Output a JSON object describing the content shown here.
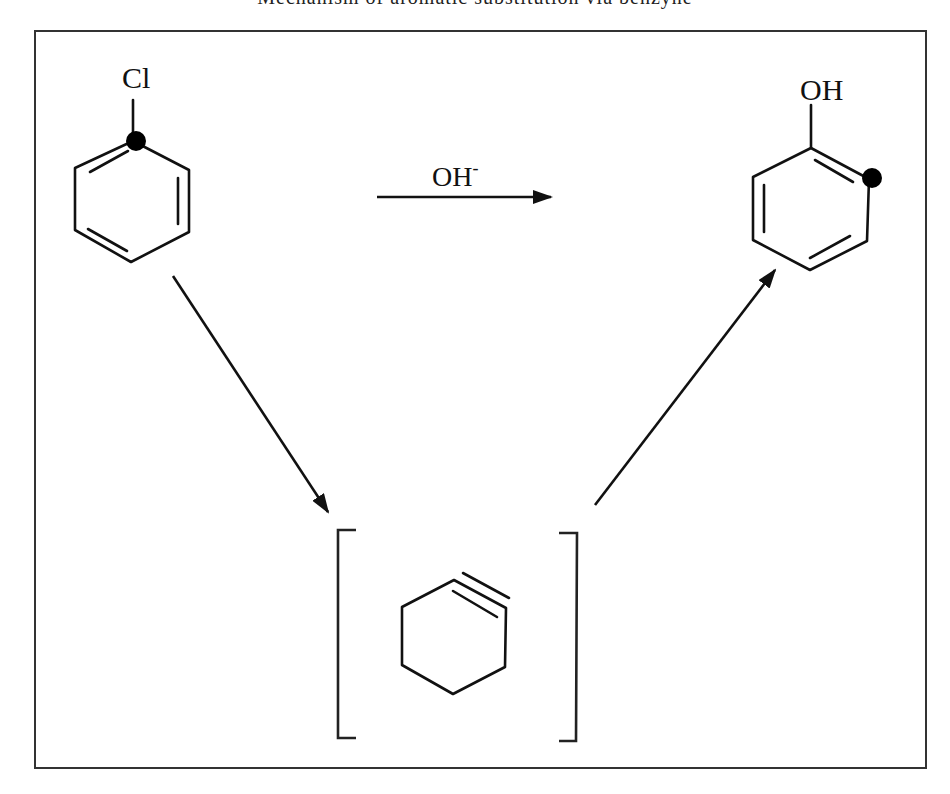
{
  "title": {
    "text": "Mechanism of aromatic substitution via benzyne",
    "visible": "clipped"
  },
  "reactant": {
    "name": "chlorobenzene",
    "substituent_label": "Cl",
    "labeled_carbon": "C1 (ipso, marked with dot)"
  },
  "product": {
    "name": "phenol",
    "substituent_label": "OH",
    "labeled_carbon": "C2 (ortho, marked with dot)"
  },
  "intermediate": {
    "name": "benzyne",
    "bracketed": true
  },
  "reagent": {
    "label": "OH",
    "charge": "-"
  },
  "arrows": [
    {
      "from": "reactant",
      "to": "product",
      "label": "OH-",
      "direction": "right"
    },
    {
      "from": "reactant",
      "to": "intermediate",
      "direction": "down-right"
    },
    {
      "from": "intermediate",
      "to": "product",
      "direction": "up-right"
    }
  ],
  "colors": {
    "ink": "#111111",
    "frame": "#333333",
    "background": "#ffffff"
  }
}
